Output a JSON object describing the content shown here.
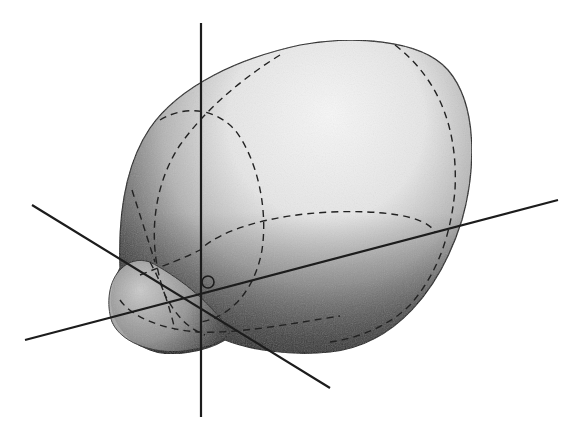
{
  "canvas": {
    "width": 584,
    "height": 444,
    "background": "#ffffff"
  },
  "figure": {
    "colors": {
      "highlight": "#f4f4f4",
      "mid": "#9a9a9a",
      "shadow": "#2a2a2a",
      "outline": "#1a1a1a",
      "axis": "#1c1c1c",
      "dash": "#222222"
    },
    "surface": {
      "main_body_path": "M 120 268 C 118 215, 125 165, 150 128 C 180 85, 240 58, 300 45 C 350 36, 420 38, 448 70 C 478 105, 476 170, 462 220 C 440 290, 395 345, 330 352 C 290 356, 250 350, 225 340 C 205 352, 170 358, 150 350 C 122 340, 108 315, 112 292 C 114 280, 118 272, 120 268 Z",
      "small_lobe_path": "M 122 268 C 108 280, 106 305, 112 322 C 122 345, 160 356, 190 350 C 215 346, 225 340, 230 332 C 210 300, 175 275, 150 262 C 138 258, 128 262, 122 268 Z",
      "highlight_center": [
        320,
        130
      ]
    },
    "axes": [
      {
        "id": "vertical-axis",
        "x1": 201,
        "y1": 23,
        "x2": 201,
        "y2": 417
      },
      {
        "id": "diagonal-axis-a",
        "x1": 32,
        "y1": 205,
        "x2": 330,
        "y2": 388
      },
      {
        "id": "diagonal-axis-b",
        "x1": 25,
        "y1": 340,
        "x2": 558,
        "y2": 200
      }
    ],
    "origin": [
      200,
      293
    ],
    "marker": {
      "cx": 208,
      "cy": 282,
      "r": 6
    },
    "dashed_contours": [
      {
        "id": "upper-vertical-ellipse",
        "d": "M 160 120 C 185 105, 215 108, 235 130 C 258 160, 268 210, 262 250 C 255 290, 230 318, 200 322"
      },
      {
        "id": "large-meridian",
        "d": "M 280 55 C 240 80, 205 110, 180 145 C 150 190, 148 250, 165 295 C 178 320, 192 330, 205 335"
      },
      {
        "id": "right-meridian",
        "d": "M 395 45 C 440 80, 458 130, 455 190 C 450 245, 432 280, 410 305 C 390 325, 360 338, 330 342"
      },
      {
        "id": "equator-upper",
        "d": "M 140 275 C 165 265, 185 258, 200 250 C 220 230, 270 215, 330 212 C 380 210, 425 215, 435 232"
      },
      {
        "id": "equator-lower",
        "d": "M 120 300 C 130 315, 160 330, 200 332 C 240 334, 300 322, 340 316"
      },
      {
        "id": "small-lobe-inner",
        "d": "M 150 262 C 160 280, 168 300, 175 330"
      },
      {
        "id": "left-inner-arc",
        "d": "M 132 190 C 140 215, 148 240, 155 262"
      }
    ]
  }
}
